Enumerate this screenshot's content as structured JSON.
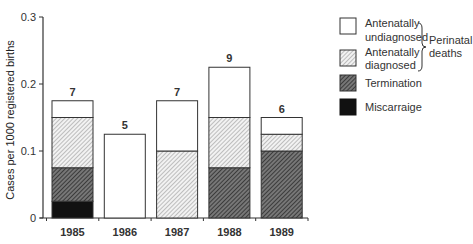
{
  "chart_data": {
    "type": "bar",
    "stacked": true,
    "title": "",
    "xlabel": "",
    "ylabel": "Cases per 1000 registered births",
    "ylim": [
      0,
      0.3
    ],
    "yticks": [
      "0",
      "0.1",
      "0.2",
      "0.3"
    ],
    "categories": [
      "1985",
      "1986",
      "1987",
      "1988",
      "1989"
    ],
    "series": [
      {
        "name": "Miscarraige",
        "pattern": "solid-black",
        "values": [
          0.025,
          0,
          0,
          0,
          0
        ]
      },
      {
        "name": "Termination",
        "pattern": "dense-hatch",
        "values": [
          0.05,
          0,
          0,
          0.075,
          0.1
        ]
      },
      {
        "name": "Antenatally diagnosed",
        "pattern": "light-hatch",
        "values": [
          0.075,
          0,
          0.1,
          0.075,
          0.025
        ]
      },
      {
        "name": "Antenatally undiagnosed",
        "pattern": "white",
        "values": [
          0.025,
          0.125,
          0.075,
          0.075,
          0.025
        ]
      }
    ],
    "bar_labels": [
      "7",
      "5",
      "7",
      "9",
      "6"
    ],
    "legend": {
      "position": "right",
      "items": [
        "Antenatally undiagnosed",
        "Antenatally diagnosed",
        "Termination",
        "Miscarraige"
      ],
      "bracket_label": "Perinatal deaths",
      "bracket_groups": [
        "Antenatally undiagnosed",
        "Antenatally diagnosed"
      ]
    },
    "grid": false
  },
  "legend_text": {
    "undiag_1": "Antenatally",
    "undiag_2": "undiagnosed",
    "diag_1": "Antenatally",
    "diag_2": "diagnosed",
    "termination": "Termination",
    "miscarriage": "Miscarraige",
    "bracket_1": "Perinatal",
    "bracket_2": "deaths"
  }
}
